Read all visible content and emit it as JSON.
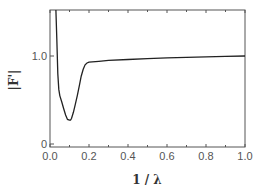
{
  "chart_data": {
    "type": "line",
    "title": "",
    "xlabel": "1 / λ",
    "ylabel": "|F'|",
    "xlim": [
      0.0,
      1.0
    ],
    "ylim": [
      0.0,
      1.5
    ],
    "xticks": [
      0.0,
      0.2,
      0.4,
      0.6,
      0.8,
      1.0
    ],
    "xtick_labels": [
      "0.0",
      "0.2",
      "0.4",
      "0.6",
      "0.8",
      "1.0"
    ],
    "yticks": [
      0,
      1.0
    ],
    "ytick_labels": [
      "0",
      "1.0"
    ],
    "grid": false,
    "legend": "none",
    "series": [
      {
        "name": "|F'|",
        "x": [
          0.03,
          0.035,
          0.04,
          0.045,
          0.05,
          0.06,
          0.07,
          0.08,
          0.09,
          0.1,
          0.105,
          0.11,
          0.12,
          0.13,
          0.14,
          0.15,
          0.16,
          0.17,
          0.18,
          0.19,
          0.2,
          0.25,
          0.3,
          0.4,
          0.5,
          0.6,
          0.7,
          0.8,
          0.9,
          1.0
        ],
        "y": [
          1.55,
          1.2,
          0.8,
          0.62,
          0.55,
          0.48,
          0.4,
          0.33,
          0.28,
          0.27,
          0.27,
          0.29,
          0.36,
          0.45,
          0.55,
          0.66,
          0.77,
          0.85,
          0.9,
          0.92,
          0.93,
          0.94,
          0.95,
          0.96,
          0.97,
          0.98,
          0.985,
          0.99,
          0.995,
          1.0
        ]
      }
    ]
  }
}
